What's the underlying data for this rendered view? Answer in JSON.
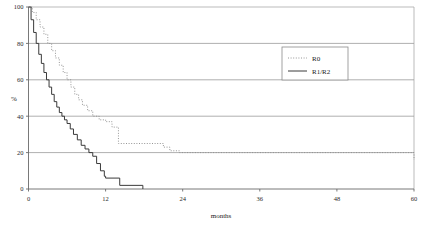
{
  "chart_data": {
    "type": "line",
    "title": "",
    "subtitle": "",
    "xlabel": "months",
    "ylabel": "%",
    "xlim": [
      0,
      60
    ],
    "ylim": [
      0,
      100
    ],
    "xticks": [
      0,
      12,
      24,
      36,
      48,
      60
    ],
    "yticks": [
      0,
      20,
      40,
      60,
      80,
      100
    ],
    "xtick_labels": [
      "0",
      "12",
      "24",
      "36",
      "48",
      "60"
    ],
    "ytick_labels": [
      "0",
      "20",
      "40",
      "60",
      "80",
      "100"
    ],
    "grid": "horizontal",
    "step_shape": "post",
    "legend_position": "upper-right-inset",
    "annotations": [],
    "series": [
      {
        "name": "R0",
        "style": "dotted",
        "color": "#8a8a8a",
        "x": [
          0,
          0.6,
          1.2,
          1.8,
          2.4,
          3.0,
          3.6,
          4.2,
          4.8,
          5.4,
          6.0,
          6.6,
          7.2,
          7.8,
          8.4,
          9.2,
          10.0,
          11.0,
          12.0,
          13.0,
          14.0,
          18.0,
          20.0,
          21.0,
          22.0,
          23.5,
          46.0,
          60.0
        ],
        "y": [
          100,
          97,
          93,
          89,
          85,
          80,
          76,
          72,
          68,
          64,
          60,
          56,
          52,
          49,
          46,
          43,
          40,
          38,
          37,
          34,
          25,
          25,
          25,
          23,
          21,
          20,
          20,
          16
        ]
      },
      {
        "name": "R1/R2",
        "style": "solid",
        "color": "#3a3a3a",
        "x": [
          0,
          0.4,
          0.8,
          1.2,
          1.6,
          2.0,
          2.4,
          2.8,
          3.2,
          3.6,
          4.0,
          4.4,
          4.8,
          5.2,
          5.6,
          6.0,
          6.5,
          7.0,
          7.6,
          8.2,
          8.8,
          9.4,
          10.0,
          10.6,
          11.2,
          11.8,
          12.0,
          14.2,
          17.8
        ],
        "y": [
          100,
          93,
          86,
          80,
          74,
          69,
          64,
          60,
          56,
          52,
          48,
          45,
          42,
          40,
          38,
          36,
          33,
          30,
          27,
          24,
          22,
          20,
          18,
          14,
          10,
          7,
          6,
          2,
          0
        ]
      }
    ]
  },
  "legend": {
    "entries": [
      {
        "label": "R0",
        "style": "dotted"
      },
      {
        "label": "R1/R2",
        "style": "solid"
      }
    ]
  },
  "colors": {
    "frame": "#aaaaaa",
    "grid": "#9a9a9a",
    "axis": "#6a6a6a",
    "r0": "#8a8a8a",
    "r1r2": "#3a3a3a",
    "legend_border": "#8a8a8a",
    "background": "#ffffff"
  }
}
